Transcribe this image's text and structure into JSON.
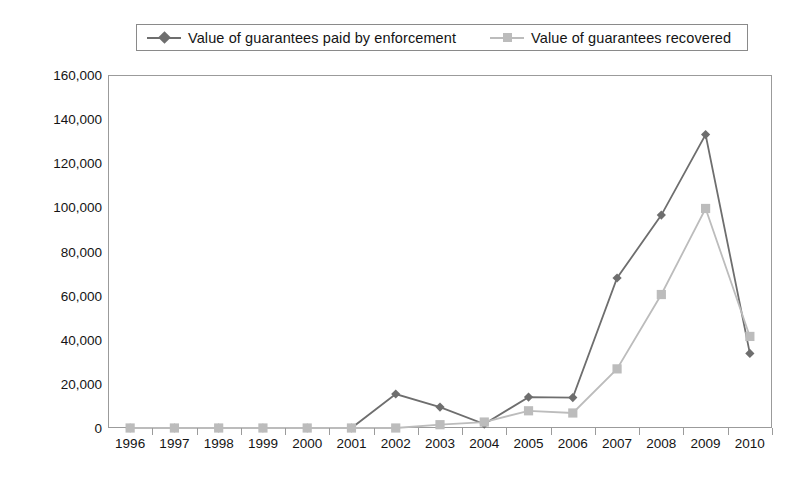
{
  "legend": {
    "position": "top",
    "entries": [
      {
        "label": "Value of guarantees paid by enforcement",
        "marker": "diamond-marker-icon",
        "color": "#6e6e6e"
      },
      {
        "label": "Value of guarantees recovered",
        "marker": "square-marker-icon",
        "color": "#bcbcbc"
      }
    ]
  },
  "chart_data": {
    "type": "line",
    "title": "",
    "subtitle": "",
    "xlabel": "",
    "ylabel": "",
    "grid": false,
    "legend_position": "top",
    "categories": [
      "1996",
      "1997",
      "1998",
      "1999",
      "2000",
      "2001",
      "2002",
      "2003",
      "2004",
      "2005",
      "2006",
      "2007",
      "2008",
      "2009",
      "2010"
    ],
    "ylim": [
      0,
      160000
    ],
    "yticks": [
      0,
      20000,
      40000,
      60000,
      80000,
      100000,
      120000,
      140000,
      160000
    ],
    "ytick_labels": [
      "0",
      "20,000",
      "40,000",
      "60,000",
      "80,000",
      "100,000",
      "120,000",
      "140,000",
      "160,000"
    ],
    "series": [
      {
        "name": "Value of guarantees paid by enforcement",
        "color": "#6e6e6e",
        "marker": "diamond",
        "values": [
          0,
          0,
          0,
          0,
          0,
          0,
          15400,
          9500,
          1800,
          14000,
          13800,
          68000,
          96500,
          133000,
          33800
        ]
      },
      {
        "name": "Value of guarantees recovered",
        "color": "#bcbcbc",
        "marker": "square",
        "values": [
          0,
          0,
          0,
          0,
          0,
          0,
          0,
          1500,
          2700,
          7800,
          6800,
          26800,
          60500,
          99500,
          41500
        ]
      }
    ]
  }
}
